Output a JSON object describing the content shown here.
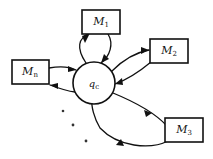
{
  "figure": {
    "background_color": "#ffffff",
    "stroke_color": "#111111"
  },
  "center_node": {
    "name": "central-state-node",
    "base": "q",
    "subscript": "c",
    "shape": "circle",
    "cx": 94,
    "cy": 83,
    "r": 21
  },
  "machine_nodes": [
    {
      "name": "machine-node-m1",
      "base": "M",
      "subscript": "1",
      "x": 82,
      "y": 10,
      "width": 38,
      "height": 24
    },
    {
      "name": "machine-node-m2",
      "base": "M",
      "subscript": "2",
      "x": 150,
      "y": 39,
      "width": 38,
      "height": 24
    },
    {
      "name": "machine-node-m3",
      "base": "M",
      "subscript": "3",
      "x": 165,
      "y": 118,
      "width": 38,
      "height": 24
    },
    {
      "name": "machine-node-mn",
      "base": "M",
      "subscript": "n",
      "x": 12,
      "y": 60,
      "width": 37,
      "height": 24
    }
  ],
  "edges": [
    {
      "name": "edge-center-to-m1",
      "from": "q_c",
      "to": "M_1",
      "direction": "outgoing",
      "path": "M 86,63 C 76,48 78,38 90,33"
    },
    {
      "name": "edge-m1-to-center",
      "from": "M_1",
      "to": "q_c",
      "direction": "incoming",
      "path": "M 108,34 C 114,44 110,56 101,63"
    },
    {
      "name": "edge-center-to-m2",
      "from": "q_c",
      "to": "M_2",
      "direction": "outgoing",
      "path": "M 112,71 C 125,58 138,52 149,50"
    },
    {
      "name": "edge-m2-to-center",
      "from": "M_2",
      "to": "q_c",
      "direction": "incoming",
      "path": "M 151,62 C 139,72 126,80 115,84"
    },
    {
      "name": "edge-center-to-m3",
      "from": "q_c",
      "to": "M_3",
      "direction": "outgoing",
      "path": "M 113,93 C 135,102 156,114 167,126"
    },
    {
      "name": "edge-m3-to-center",
      "from": "M_3",
      "to": "q_c",
      "direction": "incoming",
      "path": "M 168,141 C 150,150 118,147 100,128 C 94,118 91,106 92,99"
    },
    {
      "name": "edge-mn-to-center",
      "from": "M_n",
      "to": "q_c",
      "direction": "incoming",
      "path": "M 49,68 C 60,66 68,66 76,70"
    },
    {
      "name": "edge-center-to-mn",
      "from": "q_c",
      "to": "M_n",
      "direction": "outgoing",
      "path": "M 75,92 C 66,91 58,88 50,85"
    }
  ],
  "ellipsis": {
    "name": "ellipsis-dots",
    "label": "continuation dots",
    "dots": [
      {
        "cx": 63,
        "cy": 111,
        "r": 1.3
      },
      {
        "cx": 73,
        "cy": 125,
        "r": 1.4
      },
      {
        "cx": 86,
        "cy": 141,
        "r": 1.4
      }
    ]
  }
}
